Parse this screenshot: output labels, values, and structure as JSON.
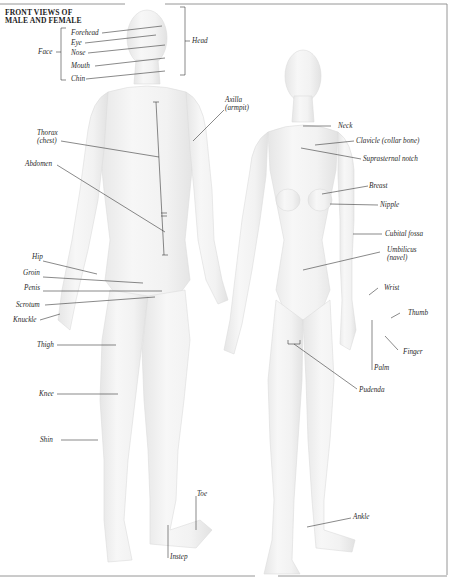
{
  "diagram": {
    "title_line1": "FRONT VIEWS OF",
    "title_line2": "MALE AND FEMALE",
    "groups": {
      "face": "Face",
      "head": "Head"
    },
    "male_labels": {
      "forehead": "Forehead",
      "eye": "Eye",
      "nose": "Nose",
      "mouth": "Mouth",
      "chin": "Chin",
      "axilla_1": "Axilla",
      "axilla_2": "(armpit)",
      "thorax_1": "Thorax",
      "thorax_2": "(chest)",
      "abdomen": "Abdomen",
      "hip": "Hip",
      "groin": "Groin",
      "penis": "Penis",
      "scrotum": "Scrotum",
      "knuckle": "Knuckle",
      "thigh": "Thigh",
      "knee": "Knee",
      "shin": "Shin",
      "toe": "Toe",
      "instep": "Instep"
    },
    "female_labels": {
      "neck": "Neck",
      "clavicle": "Clavicle (collar bone)",
      "suprasternal": "Suprasternal notch",
      "breast": "Breast",
      "nipple": "Nipple",
      "cubital": "Cubital fossa",
      "umbilicus_1": "Umbilicus",
      "umbilicus_2": "(navel)",
      "wrist": "Wrist",
      "thumb": "Thumb",
      "finger": "Finger",
      "palm": "Palm",
      "pudenda": "Pudenda",
      "ankle": "Ankle"
    },
    "colors": {
      "background": "#ffffff",
      "figure_fill": "#f3f3f3",
      "figure_shade": "#e4e4e4",
      "leader_line": "#3a3a3a",
      "border": "#8a8a8a",
      "text": "#2a2a2a"
    }
  }
}
